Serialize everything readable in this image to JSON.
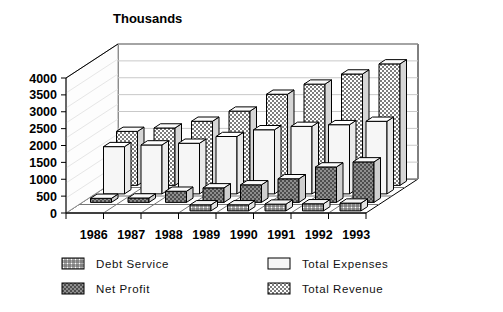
{
  "chart_data": {
    "type": "bar",
    "title": "Thousands",
    "xlabel": "",
    "ylabel": "",
    "ylim": [
      0,
      4000
    ],
    "yticks": [
      0,
      500,
      1000,
      1500,
      2000,
      2500,
      3000,
      3500,
      4000
    ],
    "ytick_labels": [
      "0",
      "500",
      "1000",
      "1500",
      "2000",
      "2500",
      "3000",
      "3500",
      "4000"
    ],
    "grid": true,
    "projection": "3d-rows",
    "legend_position": "bottom",
    "categories": [
      "1986",
      "1987",
      "1988",
      "1989",
      "1990",
      "1991",
      "1992",
      "1993"
    ],
    "series": [
      {
        "name": "Debt Service",
        "values": [
          0,
          0,
          0,
          180,
          180,
          200,
          210,
          230
        ],
        "fill": "crosshatch-fine",
        "color": "#8a8a8a"
      },
      {
        "name": "Net Profit",
        "values": [
          120,
          130,
          330,
          430,
          520,
          700,
          1050,
          1200
        ],
        "fill": "solid-dark",
        "color": "#5a5a5a"
      },
      {
        "name": "Total Expenses",
        "values": [
          1400,
          1450,
          1500,
          1700,
          1900,
          2000,
          2050,
          2150
        ],
        "fill": "empty",
        "color": "#f2f2f2"
      },
      {
        "name": "Total Revenue",
        "values": [
          1600,
          1700,
          1900,
          2200,
          2700,
          3000,
          3300,
          3600
        ],
        "fill": "checker",
        "color": "#b6b6b6"
      }
    ]
  },
  "legend": {
    "items": [
      {
        "label": "Debt Service",
        "swatch": "crosshatch-fine"
      },
      {
        "label": "Total Expenses",
        "swatch": "empty"
      },
      {
        "label": "Net Profit",
        "swatch": "solid-dark"
      },
      {
        "label": "Total Revenue",
        "swatch": "checker"
      }
    ]
  }
}
